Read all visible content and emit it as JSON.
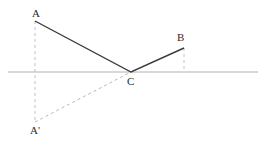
{
  "figure": {
    "canvas": {
      "width": 268,
      "height": 143,
      "background": "#ffffff"
    },
    "labels": {
      "a": "A",
      "b": "B",
      "c": "C",
      "a_prime": "A'"
    },
    "points": {
      "A": {
        "x": 35,
        "y": 21,
        "label": "A"
      },
      "B": {
        "x": 184,
        "y": 48,
        "label": "B"
      },
      "C": {
        "x": 131,
        "y": 72,
        "label": "C"
      },
      "Ap": {
        "x": 35,
        "y": 122,
        "label": "A'"
      }
    },
    "axis": {
      "name": "horizontal-mirror-line",
      "x1": 8,
      "y1": 72,
      "x2": 258,
      "y2": 72,
      "color": "#b0b0b0",
      "width": 1
    },
    "solid_path": {
      "name": "path-A-C-B",
      "points": "35,21 131,72 184,48",
      "color": "#3a3a3a",
      "width": 1.4
    },
    "dashed_segments": [
      {
        "name": "drop-line-A-to-Aprime",
        "x1": 35,
        "y1": 21,
        "x2": 35,
        "y2": 122,
        "color": "#c2c2c2",
        "dash": "3,3"
      },
      {
        "name": "drop-line-B-to-axis",
        "x1": 184,
        "y1": 48,
        "x2": 184,
        "y2": 72,
        "color": "#c2c2c2",
        "dash": "3,3"
      },
      {
        "name": "reflected-ray-Aprime-to-C",
        "x1": 35,
        "y1": 122,
        "x2": 131,
        "y2": 72,
        "color": "#b8b8b8",
        "dash": "3,3"
      }
    ],
    "colors": {
      "solid_stroke": "#3a3a3a",
      "dashed_stroke": "#c2c2c2",
      "axis_stroke": "#b0b0b0",
      "label_text": "#2b2b2b",
      "background": "#ffffff"
    }
  }
}
